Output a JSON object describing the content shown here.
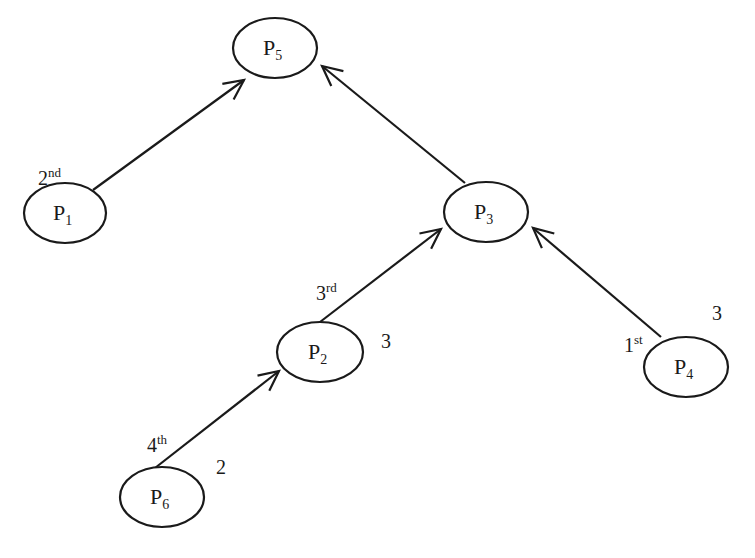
{
  "diagram": {
    "title": "",
    "nodes": [
      {
        "id": "P5",
        "letter": "P",
        "subscript": "5",
        "order": null,
        "weight": null
      },
      {
        "id": "P1",
        "letter": "P",
        "subscript": "1",
        "order": {
          "num": "2",
          "suffix": "nd"
        },
        "weight": null
      },
      {
        "id": "P3",
        "letter": "P",
        "subscript": "3",
        "order": null,
        "weight": null
      },
      {
        "id": "P2",
        "letter": "P",
        "subscript": "2",
        "order": {
          "num": "3",
          "suffix": "rd"
        },
        "weight": "3"
      },
      {
        "id": "P4",
        "letter": "P",
        "subscript": "4",
        "order": {
          "num": "1",
          "suffix": "st"
        },
        "weight": "3"
      },
      {
        "id": "P6",
        "letter": "P",
        "subscript": "6",
        "order": {
          "num": "4",
          "suffix": "th"
        },
        "weight": "2"
      }
    ],
    "edges": [
      {
        "from": "P1",
        "to": "P5"
      },
      {
        "from": "P3",
        "to": "P5"
      },
      {
        "from": "P2",
        "to": "P3"
      },
      {
        "from": "P4",
        "to": "P3"
      },
      {
        "from": "P6",
        "to": "P2"
      }
    ]
  }
}
